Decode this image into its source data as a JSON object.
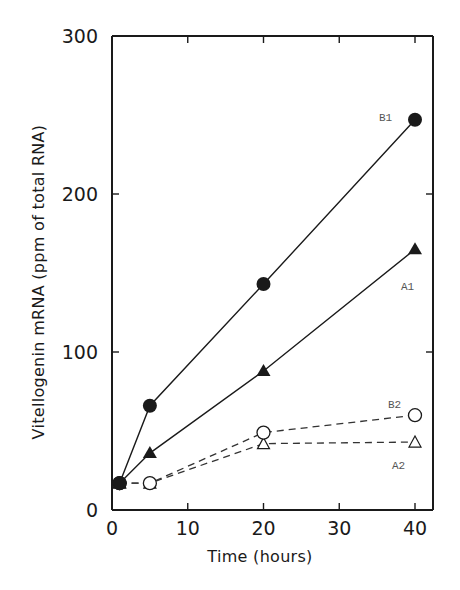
{
  "chart_data": {
    "type": "line",
    "title": "",
    "xlabel": "Time (hours)",
    "ylabel": "Vitellogenin mRNA (ppm of total RNA)",
    "xlim": [
      0,
      40
    ],
    "ylim": [
      0,
      300
    ],
    "xticks": [
      0,
      10,
      20,
      30,
      40
    ],
    "yticks": [
      0,
      100,
      200,
      300
    ],
    "grid": false,
    "legend": "inline labels at series ends",
    "series": [
      {
        "name": "B1",
        "marker": "filled-circle",
        "line": "solid",
        "x": [
          1,
          5,
          20,
          40
        ],
        "y": [
          17,
          66,
          143,
          247
        ]
      },
      {
        "name": "A1",
        "marker": "filled-triangle",
        "line": "solid",
        "x": [
          1,
          5,
          20,
          40
        ],
        "y": [
          17,
          36,
          88,
          165
        ]
      },
      {
        "name": "B2",
        "marker": "open-circle",
        "line": "dashed",
        "x": [
          1,
          5,
          20,
          40
        ],
        "y": [
          17,
          17,
          49,
          60
        ]
      },
      {
        "name": "A2",
        "marker": "open-triangle",
        "line": "dashed",
        "x": [
          1,
          5,
          20,
          40
        ],
        "y": [
          17,
          17,
          42,
          43
        ]
      }
    ]
  },
  "axes": {
    "x_title": "Time (hours)",
    "y_title": "Vitellogenin mRNA (ppm of total RNA)",
    "x_tick_labels": [
      "0",
      "10",
      "20",
      "30",
      "40"
    ],
    "y_tick_labels": [
      "0",
      "100",
      "200",
      "300"
    ]
  },
  "labels": {
    "B1": "B1",
    "A1": "A1",
    "B2": "B2",
    "A2": "A2"
  },
  "colors": {
    "ink": "#1a1a1a",
    "label": "#555555",
    "background": "#ffffff"
  }
}
